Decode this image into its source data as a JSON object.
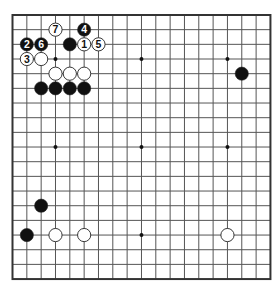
{
  "board": {
    "size": 19,
    "origin_x": 12.5,
    "origin_y": 15,
    "spacing_x": 14.33,
    "spacing_y": 14.67,
    "line_color": "#555555",
    "border_color": "#333333",
    "star_points": [
      [
        3,
        3
      ],
      [
        9,
        3
      ],
      [
        15,
        3
      ],
      [
        3,
        9
      ],
      [
        9,
        9
      ],
      [
        15,
        9
      ],
      [
        3,
        15
      ],
      [
        9,
        15
      ],
      [
        15,
        15
      ]
    ],
    "stones": [
      {
        "color": "black",
        "col": 4,
        "row": 2,
        "label": ""
      },
      {
        "color": "white",
        "col": 2,
        "row": 3,
        "label": ""
      },
      {
        "color": "white",
        "col": 3,
        "row": 4,
        "label": ""
      },
      {
        "color": "white",
        "col": 4,
        "row": 4,
        "label": ""
      },
      {
        "color": "white",
        "col": 5,
        "row": 4,
        "label": ""
      },
      {
        "color": "black",
        "col": 2,
        "row": 5,
        "label": ""
      },
      {
        "color": "black",
        "col": 3,
        "row": 5,
        "label": ""
      },
      {
        "color": "black",
        "col": 4,
        "row": 5,
        "label": ""
      },
      {
        "color": "black",
        "col": 5,
        "row": 5,
        "label": ""
      },
      {
        "color": "black",
        "col": 16,
        "row": 4,
        "label": ""
      },
      {
        "color": "black",
        "col": 2,
        "row": 13,
        "label": ""
      },
      {
        "color": "black",
        "col": 1,
        "row": 15,
        "label": ""
      },
      {
        "color": "white",
        "col": 3,
        "row": 15,
        "label": ""
      },
      {
        "color": "white",
        "col": 5,
        "row": 15,
        "label": ""
      },
      {
        "color": "white",
        "col": 15,
        "row": 15,
        "label": ""
      },
      {
        "color": "white",
        "col": 5,
        "row": 2,
        "label": "1"
      },
      {
        "color": "black",
        "col": 1,
        "row": 2,
        "label": "2"
      },
      {
        "color": "white",
        "col": 1,
        "row": 3,
        "label": "3"
      },
      {
        "color": "black",
        "col": 5,
        "row": 1,
        "label": "4"
      },
      {
        "color": "white",
        "col": 6,
        "row": 2,
        "label": "5"
      },
      {
        "color": "black",
        "col": 2,
        "row": 2,
        "label": "6"
      },
      {
        "color": "white",
        "col": 3,
        "row": 1,
        "label": "7"
      }
    ]
  }
}
